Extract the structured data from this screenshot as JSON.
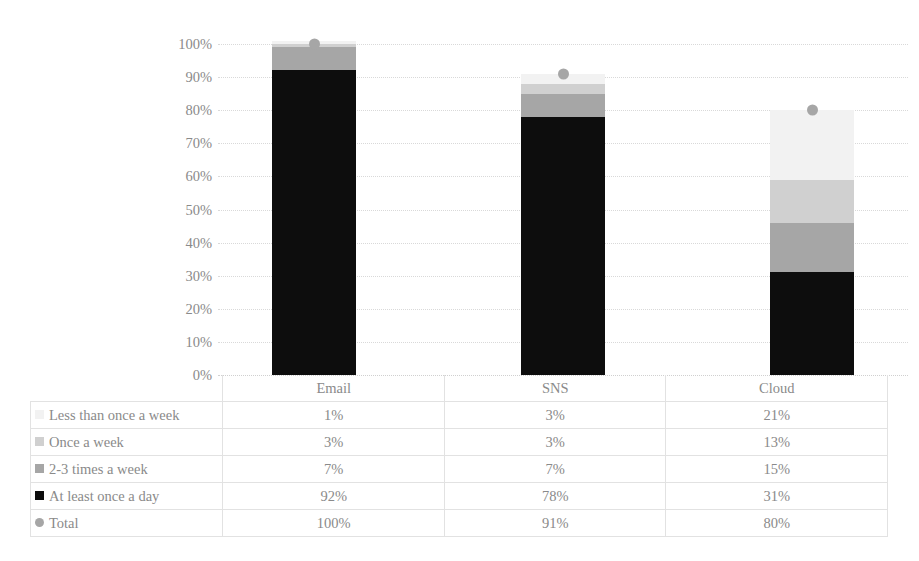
{
  "chart_data": {
    "type": "bar",
    "stacked": true,
    "title": "",
    "xlabel": "",
    "ylabel": "",
    "ylim": [
      0,
      100
    ],
    "ytick_labels": [
      "100%",
      "90%",
      "80%",
      "70%",
      "60%",
      "50%",
      "40%",
      "30%",
      "20%",
      "10%",
      "0%"
    ],
    "ytick_values": [
      100,
      90,
      80,
      70,
      60,
      50,
      40,
      30,
      20,
      10,
      0
    ],
    "grid": true,
    "legend_position": "data-table",
    "categories": [
      "Email",
      "SNS",
      "Cloud"
    ],
    "series": [
      {
        "name": "Less than once a week",
        "values": [
          1,
          3,
          21
        ],
        "display": [
          "1%",
          "3%",
          "21%"
        ],
        "color": "#f2f2f2",
        "marker": "square"
      },
      {
        "name": "Once a week",
        "values": [
          1,
          3,
          13
        ],
        "display": [
          "1%",
          "3%",
          "13%"
        ],
        "color": "#d0d0d0",
        "marker": "square"
      },
      {
        "name": "2-3 times a week",
        "values": [
          7,
          7,
          15
        ],
        "display": [
          "7%",
          "7%",
          "15%"
        ],
        "color": "#a6a6a6",
        "marker": "square"
      },
      {
        "name": "At least once a day",
        "values": [
          92,
          78,
          31
        ],
        "display": [
          "92%",
          "78%",
          "31%"
        ],
        "color": "#0d0d0d",
        "marker": "square"
      },
      {
        "name": "Total",
        "values": [
          100,
          91,
          80
        ],
        "display": [
          "100%",
          "91%",
          "80%"
        ],
        "color": "#a6a6a6",
        "marker": "circle"
      }
    ],
    "stack_order_bottom_to_top": [
      "At least once a day",
      "2-3 times a week",
      "Once a week",
      "Less than once a week"
    ]
  },
  "table": {
    "header_label": "",
    "columns": [
      "Email",
      "SNS",
      "Cloud"
    ],
    "rows": [
      {
        "label": "Less than once a week",
        "marker_color": "#f2f2f2",
        "marker_shape": "square",
        "cells": [
          "1%",
          "3%",
          "21%"
        ]
      },
      {
        "label": "Once a week",
        "marker_color": "#d0d0d0",
        "marker_shape": "square",
        "cells": [
          "3%",
          "3%",
          "13%"
        ]
      },
      {
        "label": "2-3 times a week",
        "marker_color": "#a6a6a6",
        "marker_shape": "square",
        "cells": [
          "7%",
          "7%",
          "15%"
        ]
      },
      {
        "label": "At least once a day",
        "marker_color": "#0d0d0d",
        "marker_shape": "square",
        "cells": [
          "92%",
          "78%",
          "31%"
        ]
      },
      {
        "label": "Total",
        "marker_color": "#a6a6a6",
        "marker_shape": "circle",
        "cells": [
          "100%",
          "91%",
          "80%"
        ]
      }
    ]
  },
  "colors": {
    "less_than_once_a_week": "#f2f2f2",
    "once_a_week": "#d0d0d0",
    "two_three_times_a_week": "#a6a6a6",
    "at_least_once_a_day": "#0d0d0d",
    "total_marker": "#a6a6a6",
    "gridline": "#d9d9d9",
    "table_border": "#e2e2e2",
    "text": "#8a8a8a",
    "background": "#ffffff"
  }
}
